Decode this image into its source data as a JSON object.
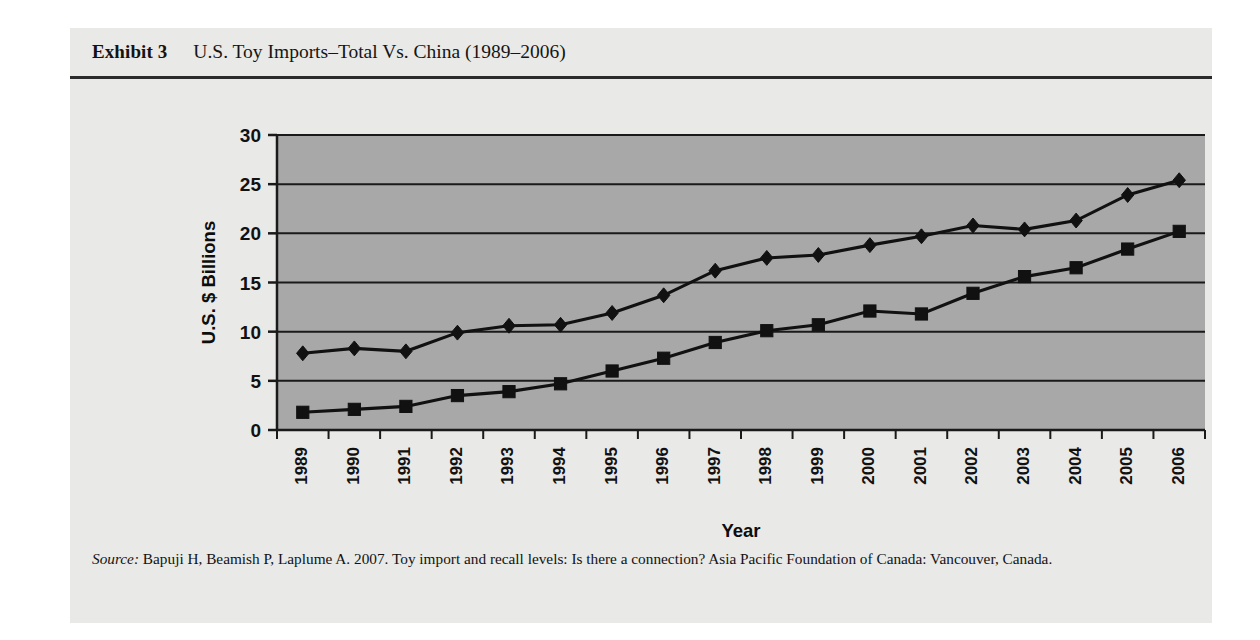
{
  "exhibit": {
    "label": "Exhibit 3",
    "title": "U.S. Toy Imports–Total Vs. China (1989–2006)",
    "source_label": "Source:",
    "source_text": " Bapuji H, Beamish P, Laplume A. 2007. Toy import and recall levels: Is there a connection? Asia Pacific Foundation of Canada: Vancouver, Canada."
  },
  "colors": {
    "panel_background": "#e9e9e7",
    "plot_background": "#a8a8a8",
    "axis_line": "#1a1a1a",
    "gridline": "#1a1a1a",
    "series_line": "#111111",
    "page_background": "#ffffff",
    "text": "#131313"
  },
  "chart_data": {
    "type": "line",
    "title": "U.S. Toy Imports–Total Vs. China (1989–2006)",
    "xlabel": "Year",
    "ylabel": "U.S. $ Billions",
    "categories": [
      "1989",
      "1990",
      "1991",
      "1992",
      "1993",
      "1994",
      "1995",
      "1996",
      "1997",
      "1998",
      "1999",
      "2000",
      "2001",
      "2002",
      "2003",
      "2004",
      "2005",
      "2006"
    ],
    "x_tick_labels": [
      "1989",
      "1990",
      "1991",
      "1992",
      "1993",
      "1994",
      "1995",
      "1996",
      "1997",
      "1998",
      "1999",
      "2000",
      "2001",
      "2002",
      "2003",
      "2004",
      "2005",
      "2006"
    ],
    "x_tick_rotation": -90,
    "y_tick_labels": [
      "0",
      "5",
      "10",
      "15",
      "20",
      "25",
      "30"
    ],
    "y_ticks": [
      0,
      5,
      10,
      15,
      20,
      25,
      30
    ],
    "ylim": [
      0,
      30
    ],
    "grid": "horizontal",
    "legend_position": "bottom",
    "series": [
      {
        "name": "Total U.S. Imports",
        "marker": "diamond",
        "values": [
          7.8,
          8.3,
          8.0,
          9.9,
          10.6,
          10.7,
          11.9,
          13.7,
          16.2,
          17.5,
          17.8,
          18.8,
          19.7,
          20.8,
          20.4,
          21.3,
          23.9,
          25.4
        ]
      },
      {
        "name": "U.S. Imports from China",
        "marker": "square",
        "values": [
          1.8,
          2.1,
          2.4,
          3.5,
          3.9,
          4.7,
          6.0,
          7.3,
          8.9,
          10.1,
          10.7,
          12.1,
          11.8,
          13.9,
          15.6,
          16.5,
          18.4,
          20.2
        ]
      }
    ]
  }
}
